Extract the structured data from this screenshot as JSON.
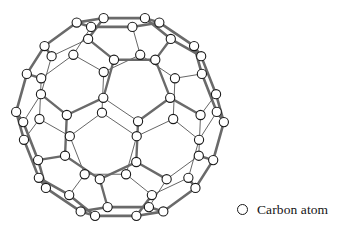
{
  "figure": {
    "molecule_name": "C60 fullerene",
    "atom_count": 60,
    "background_color": "#ffffff"
  },
  "legend": {
    "symbol_name": "open-circle",
    "label": "Carbon atom",
    "symbol_color": "#1a1a1a",
    "symbol_fill": "#ffffff"
  },
  "style": {
    "atom_radius": 4.6,
    "atom_stroke": "#1a1a1a",
    "atom_fill": "#ffffff",
    "atom_stroke_width": 1.1,
    "bond_thin_color": "#4a4a4a",
    "bond_thin_width": 0.85,
    "bond_bold_color": "#6a6a6a",
    "bond_bold_width": 2.6,
    "bond_bold_edge_color": "#3a3a3a"
  },
  "geometry": {
    "projection": "orthographic",
    "center": [
      120,
      117
    ],
    "scale": 104,
    "tilt_x_deg": 14,
    "tilt_y_deg": 10,
    "tilt_z_deg": 0,
    "phi": 1.6180339887,
    "comment": "Truncated icosahedron vertices generated from even permutations of (0,+-1,+-3phi), (+-1,+-(2+phi),+-2phi), (+-phi,+-2,+-(2phi+1)) divided by norm.",
    "bold_cycle_scale": 1.0
  },
  "chart_data": {
    "type": "diagram",
    "subtype": "molecular-structure",
    "nodes_label": "Carbon atom",
    "node_count": 60,
    "edge_count": 90,
    "faces": {
      "pentagons": 12,
      "hexagons": 20
    }
  }
}
